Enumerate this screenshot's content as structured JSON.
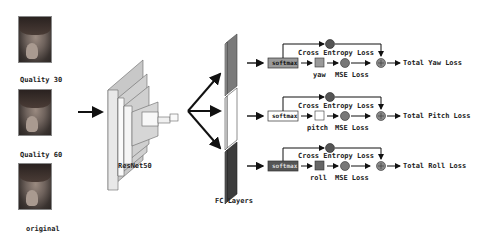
{
  "inputs": [
    {
      "label": "Quality 30"
    },
    {
      "label": "Quality 60"
    },
    {
      "label": "original"
    }
  ],
  "backbone": {
    "label": "ResNet50"
  },
  "fc": {
    "label": "FC Layers"
  },
  "branches": [
    {
      "name": "yaw",
      "softmax": "softmax",
      "ce_loss": "Cross Entropy Loss",
      "mse_loss": "MSE Loss",
      "total": "Total Yaw Loss",
      "fc_color": "#7a7a7a",
      "softmax_fill": "#9a9a9a",
      "square_fill": "#9a9a9a"
    },
    {
      "name": "pitch",
      "softmax": "softmax",
      "ce_loss": "Cross Entropy Loss",
      "mse_loss": "MSE Loss",
      "total": "Total Pitch Loss",
      "fc_color": "#ffffff",
      "softmax_fill": "#ffffff",
      "square_fill": "#ffffff"
    },
    {
      "name": "roll",
      "softmax": "softmax",
      "ce_loss": "Cross Entropy Loss",
      "mse_loss": "MSE Loss",
      "total": "Total Roll Loss",
      "fc_color": "#3c3c3c",
      "softmax_fill": "#555555",
      "square_fill": "#666666"
    }
  ]
}
